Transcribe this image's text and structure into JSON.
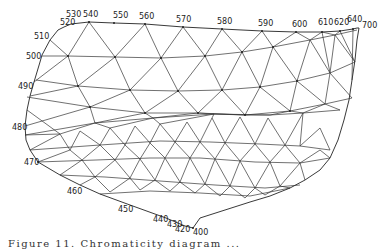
{
  "figure": {
    "type": "triangulated chromaticity mesh",
    "locus_labels": [
      {
        "text": "400",
        "x": 193,
        "y": 235
      },
      {
        "text": "420",
        "x": 175,
        "y": 232
      },
      {
        "text": "430",
        "x": 167,
        "y": 227
      },
      {
        "text": "440",
        "x": 153,
        "y": 222
      },
      {
        "text": "450",
        "x": 118,
        "y": 212
      },
      {
        "text": "460",
        "x": 67,
        "y": 194
      },
      {
        "text": "470",
        "x": 24,
        "y": 165
      },
      {
        "text": "480",
        "x": 12,
        "y": 130
      },
      {
        "text": "490",
        "x": 18,
        "y": 89
      },
      {
        "text": "500",
        "x": 26,
        "y": 59
      },
      {
        "text": "510",
        "x": 34,
        "y": 39
      },
      {
        "text": "520",
        "x": 60,
        "y": 25
      },
      {
        "text": "530",
        "x": 66,
        "y": 17
      },
      {
        "text": "540",
        "x": 83,
        "y": 17
      },
      {
        "text": "550",
        "x": 113,
        "y": 18
      },
      {
        "text": "560",
        "x": 139,
        "y": 19
      },
      {
        "text": "570",
        "x": 176,
        "y": 22
      },
      {
        "text": "580",
        "x": 217,
        "y": 24
      },
      {
        "text": "590",
        "x": 258,
        "y": 26
      },
      {
        "text": "600",
        "x": 292,
        "y": 27
      },
      {
        "text": "610",
        "x": 318,
        "y": 25
      },
      {
        "text": "620",
        "x": 334,
        "y": 25
      },
      {
        "text": "640",
        "x": 347,
        "y": 22
      },
      {
        "text": "700",
        "x": 362,
        "y": 28
      }
    ],
    "caption": "Figure 11.   Chromaticity   diagram   ..."
  }
}
